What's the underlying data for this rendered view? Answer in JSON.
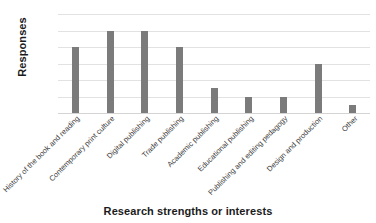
{
  "chart_data": {
    "type": "bar",
    "title": "",
    "xlabel": "Research strengths or interests",
    "ylabel": "Responses",
    "ylim": [
      0,
      12
    ],
    "yticks": [
      0,
      2,
      4,
      6,
      8,
      10,
      12
    ],
    "grid": true,
    "legend": "none",
    "bar_color": "#7b7b7b",
    "gridline_color": "#e2e2e2",
    "categories": [
      "History of the book and reading",
      "Contemporary print culture",
      "Digital publishing",
      "Trade publishing",
      "Academic publishing",
      "Educational publishing",
      "Publishing and editing pedagogy",
      "Design and production",
      "Other"
    ],
    "values": [
      8,
      10,
      10,
      8,
      3,
      2,
      2,
      6,
      1
    ]
  }
}
